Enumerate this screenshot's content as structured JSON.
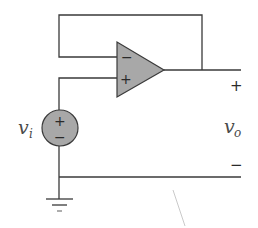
{
  "diagram": {
    "type": "circuit",
    "colors": {
      "wire": "#3a3a3a",
      "component_fill": "#a8a8a8",
      "background": "#ffffff"
    },
    "components": {
      "opamp": {
        "name": "op-amp",
        "inverting_input_sign": "−",
        "noninverting_input_sign": "+"
      },
      "source": {
        "name": "voltage-source",
        "label_base": "v",
        "label_sub": "i",
        "positive_sign": "+",
        "negative_sign": "−"
      },
      "ground": {
        "name": "ground"
      }
    },
    "output": {
      "label_base": "v",
      "label_sub": "o",
      "positive_sign": "+",
      "negative_sign": "−"
    }
  }
}
